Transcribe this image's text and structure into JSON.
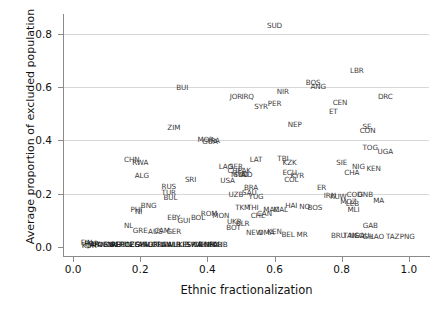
{
  "chart_data": {
    "type": "scatter",
    "title": "",
    "xlabel": "Ethnic fractionalization",
    "ylabel": "Average proportion of excluded population",
    "xlim": [
      -0.03,
      1.06
    ],
    "ylim": [
      -0.035,
      0.875
    ],
    "xticks": [
      "0.0",
      "0.2",
      "0.4",
      "0.6",
      "0.8",
      "1.0"
    ],
    "xtickvalues": [
      0.0,
      0.2,
      0.4,
      0.6,
      0.8,
      1.0
    ],
    "yticks": [
      "0.0",
      "0.2",
      "0.4",
      "0.6",
      "0.8"
    ],
    "ytickvalues": [
      0.0,
      0.2,
      0.4,
      0.6,
      0.8
    ],
    "grid": "horizontal",
    "legend": "none",
    "marker_style": "text-label",
    "note": "Each data point is rendered as a 2-4 letter country abbreviation placed at its (x,y) coordinate. Many labels overlap heavily, especially along y=0.",
    "points": [
      {
        "label": "SUD",
        "x": 0.6,
        "y": 0.835
      },
      {
        "label": "LBR",
        "x": 0.845,
        "y": 0.665
      },
      {
        "label": "BUI",
        "x": 0.325,
        "y": 0.6
      },
      {
        "label": "BOS",
        "x": 0.715,
        "y": 0.62
      },
      {
        "label": "ANG",
        "x": 0.73,
        "y": 0.605
      },
      {
        "label": "NIR",
        "x": 0.625,
        "y": 0.585
      },
      {
        "label": "JOR",
        "x": 0.485,
        "y": 0.565
      },
      {
        "label": "IRQ",
        "x": 0.52,
        "y": 0.565
      },
      {
        "label": "DRC",
        "x": 0.93,
        "y": 0.565
      },
      {
        "label": "CEN",
        "x": 0.795,
        "y": 0.545
      },
      {
        "label": "SYR",
        "x": 0.56,
        "y": 0.53
      },
      {
        "label": "PER",
        "x": 0.6,
        "y": 0.54
      },
      {
        "label": "ET",
        "x": 0.775,
        "y": 0.51
      },
      {
        "label": "ZIM",
        "x": 0.3,
        "y": 0.45
      },
      {
        "label": "NEP",
        "x": 0.66,
        "y": 0.46
      },
      {
        "label": "SE",
        "x": 0.875,
        "y": 0.455
      },
      {
        "label": "CON",
        "x": 0.877,
        "y": 0.44
      },
      {
        "label": "MOR",
        "x": 0.395,
        "y": 0.405
      },
      {
        "label": "GUA",
        "x": 0.408,
        "y": 0.398
      },
      {
        "label": "IRA",
        "x": 0.42,
        "y": 0.4
      },
      {
        "label": "TOG",
        "x": 0.885,
        "y": 0.375
      },
      {
        "label": "UGA",
        "x": 0.93,
        "y": 0.36
      },
      {
        "label": "CHN",
        "x": 0.175,
        "y": 0.33
      },
      {
        "label": "RWA",
        "x": 0.2,
        "y": 0.32
      },
      {
        "label": "LAT",
        "x": 0.545,
        "y": 0.33
      },
      {
        "label": "TBI",
        "x": 0.625,
        "y": 0.335
      },
      {
        "label": "KZK",
        "x": 0.645,
        "y": 0.32
      },
      {
        "label": "SIE",
        "x": 0.8,
        "y": 0.32
      },
      {
        "label": "NIG",
        "x": 0.85,
        "y": 0.305
      },
      {
        "label": "KEN",
        "x": 0.895,
        "y": 0.295
      },
      {
        "label": "CHA",
        "x": 0.83,
        "y": 0.28
      },
      {
        "label": "LAO",
        "x": 0.455,
        "y": 0.305
      },
      {
        "label": "SER",
        "x": 0.485,
        "y": 0.305
      },
      {
        "label": "CHI",
        "x": 0.478,
        "y": 0.29
      },
      {
        "label": "PAK",
        "x": 0.51,
        "y": 0.29
      },
      {
        "label": "MYA",
        "x": 0.492,
        "y": 0.275
      },
      {
        "label": "SUD2",
        "x": 0.5,
        "y": 0.272
      },
      {
        "label": "IND",
        "x": 0.515,
        "y": 0.272
      },
      {
        "label": "ECU",
        "x": 0.645,
        "y": 0.282
      },
      {
        "label": "KYR",
        "x": 0.668,
        "y": 0.268
      },
      {
        "label": "COL",
        "x": 0.65,
        "y": 0.255
      },
      {
        "label": "ALG",
        "x": 0.205,
        "y": 0.27
      },
      {
        "label": "SRI",
        "x": 0.35,
        "y": 0.255
      },
      {
        "label": "USA",
        "x": 0.46,
        "y": 0.25
      },
      {
        "label": "RUS",
        "x": 0.285,
        "y": 0.23
      },
      {
        "label": "BRA",
        "x": 0.53,
        "y": 0.225
      },
      {
        "label": "ER",
        "x": 0.74,
        "y": 0.225
      },
      {
        "label": "TUR",
        "x": 0.285,
        "y": 0.205
      },
      {
        "label": "UZB",
        "x": 0.485,
        "y": 0.2
      },
      {
        "label": "SAU",
        "x": 0.525,
        "y": 0.205
      },
      {
        "label": "YUG",
        "x": 0.545,
        "y": 0.192
      },
      {
        "label": "IRN",
        "x": 0.765,
        "y": 0.195
      },
      {
        "label": "KUW",
        "x": 0.79,
        "y": 0.192
      },
      {
        "label": "COD",
        "x": 0.838,
        "y": 0.2
      },
      {
        "label": "GNB",
        "x": 0.87,
        "y": 0.2
      },
      {
        "label": "BUL",
        "x": 0.29,
        "y": 0.185
      },
      {
        "label": "MA",
        "x": 0.91,
        "y": 0.175
      },
      {
        "label": "MOZ",
        "x": 0.82,
        "y": 0.17
      },
      {
        "label": "LEB",
        "x": 0.832,
        "y": 0.165
      },
      {
        "label": "BNG",
        "x": 0.225,
        "y": 0.155
      },
      {
        "label": "PHI",
        "x": 0.188,
        "y": 0.14
      },
      {
        "label": "NI",
        "x": 0.195,
        "y": 0.135
      },
      {
        "label": "HAI",
        "x": 0.65,
        "y": 0.155
      },
      {
        "label": "NO",
        "x": 0.69,
        "y": 0.152
      },
      {
        "label": "BOS2",
        "x": 0.72,
        "y": 0.15
      },
      {
        "label": "MLI",
        "x": 0.835,
        "y": 0.14
      },
      {
        "label": "TKM",
        "x": 0.505,
        "y": 0.15
      },
      {
        "label": "THI",
        "x": 0.535,
        "y": 0.15
      },
      {
        "label": "CAN",
        "x": 0.57,
        "y": 0.128
      },
      {
        "label": "MAC",
        "x": 0.59,
        "y": 0.14
      },
      {
        "label": "MAL",
        "x": 0.618,
        "y": 0.14
      },
      {
        "label": "ROM",
        "x": 0.405,
        "y": 0.128
      },
      {
        "label": "BOL",
        "x": 0.372,
        "y": 0.112
      },
      {
        "label": "MON",
        "x": 0.44,
        "y": 0.118
      },
      {
        "label": "CHL",
        "x": 0.55,
        "y": 0.118
      },
      {
        "label": "GAB",
        "x": 0.885,
        "y": 0.082
      },
      {
        "label": "EBY",
        "x": 0.3,
        "y": 0.11
      },
      {
        "label": "GUI",
        "x": 0.33,
        "y": 0.1
      },
      {
        "label": "UKR",
        "x": 0.48,
        "y": 0.098
      },
      {
        "label": "BLR",
        "x": 0.505,
        "y": 0.09
      },
      {
        "label": "BOT",
        "x": 0.478,
        "y": 0.075
      },
      {
        "label": "NL",
        "x": 0.165,
        "y": 0.08
      },
      {
        "label": "GRE",
        "x": 0.2,
        "y": 0.062
      },
      {
        "label": "AUS",
        "x": 0.245,
        "y": 0.06
      },
      {
        "label": "CAM",
        "x": 0.265,
        "y": 0.062
      },
      {
        "label": "GER",
        "x": 0.3,
        "y": 0.06
      },
      {
        "label": "NEW",
        "x": 0.54,
        "y": 0.055
      },
      {
        "label": "OMA",
        "x": 0.575,
        "y": 0.055
      },
      {
        "label": "KEN2",
        "x": 0.6,
        "y": 0.06
      },
      {
        "label": "BEL",
        "x": 0.64,
        "y": 0.048
      },
      {
        "label": "MR",
        "x": 0.682,
        "y": 0.048
      },
      {
        "label": "BRU",
        "x": 0.79,
        "y": 0.045
      },
      {
        "label": "TAN",
        "x": 0.825,
        "y": 0.045
      },
      {
        "label": "NGA",
        "x": 0.845,
        "y": 0.045
      },
      {
        "label": "SOU",
        "x": 0.86,
        "y": 0.045
      },
      {
        "label": "GH",
        "x": 0.878,
        "y": 0.042
      },
      {
        "label": "LAO2",
        "x": 0.905,
        "y": 0.042
      },
      {
        "label": "TAZ",
        "x": 0.952,
        "y": 0.042
      },
      {
        "label": "PNG",
        "x": 0.995,
        "y": 0.042
      },
      {
        "label": "FIN",
        "x": 0.04,
        "y": 0.018
      },
      {
        "label": "POR",
        "x": 0.055,
        "y": 0.015
      },
      {
        "label": "ITA",
        "x": 0.07,
        "y": 0.012
      },
      {
        "label": "JAP",
        "x": 0.06,
        "y": 0.01
      },
      {
        "label": "KOR",
        "x": 0.048,
        "y": 0.008
      },
      {
        "label": "DEN",
        "x": 0.095,
        "y": 0.012
      },
      {
        "label": "NOR",
        "x": 0.105,
        "y": 0.01
      },
      {
        "label": "SWE",
        "x": 0.115,
        "y": 0.012
      },
      {
        "label": "IRE",
        "x": 0.125,
        "y": 0.01
      },
      {
        "label": "AUT",
        "x": 0.135,
        "y": 0.012
      },
      {
        "label": "HUN",
        "x": 0.15,
        "y": 0.01
      },
      {
        "label": "POL",
        "x": 0.16,
        "y": 0.012
      },
      {
        "label": "CZE",
        "x": 0.175,
        "y": 0.01
      },
      {
        "label": "EGY",
        "x": 0.19,
        "y": 0.012
      },
      {
        "label": "SPA",
        "x": 0.205,
        "y": 0.01
      },
      {
        "label": "ARG",
        "x": 0.215,
        "y": 0.012
      },
      {
        "label": "SLO",
        "x": 0.23,
        "y": 0.01
      },
      {
        "label": "URU",
        "x": 0.245,
        "y": 0.012
      },
      {
        "label": "FRA",
        "x": 0.258,
        "y": 0.01
      },
      {
        "label": "TUN",
        "x": 0.27,
        "y": 0.012
      },
      {
        "label": "SWI",
        "x": 0.285,
        "y": 0.01
      },
      {
        "label": "ALB",
        "x": 0.3,
        "y": 0.012
      },
      {
        "label": "UK",
        "x": 0.312,
        "y": 0.01
      },
      {
        "label": "LIB",
        "x": 0.33,
        "y": 0.012
      },
      {
        "label": "ESP",
        "x": 0.345,
        "y": 0.01
      },
      {
        "label": "SWA",
        "x": 0.36,
        "y": 0.012
      },
      {
        "label": "CR",
        "x": 0.372,
        "y": 0.01
      },
      {
        "label": "VEN",
        "x": 0.385,
        "y": 0.012
      },
      {
        "label": "DOM",
        "x": 0.398,
        "y": 0.01
      },
      {
        "label": "MEX",
        "x": 0.412,
        "y": 0.012
      },
      {
        "label": "PAR",
        "x": 0.425,
        "y": 0.01
      },
      {
        "label": "CUB",
        "x": 0.438,
        "y": 0.012
      }
    ]
  },
  "axes": {
    "y_title": "Average proportion of excluded population",
    "x_title": "Ethnic fractionalization"
  }
}
